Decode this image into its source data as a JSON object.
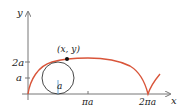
{
  "diagram": {
    "axes": {
      "x_label": "x",
      "y_label": "y"
    },
    "y_ticks": [
      {
        "label": "2a",
        "pixel_y": 62
      },
      {
        "label": "a",
        "pixel_y": 78
      }
    ],
    "x_ticks": [
      {
        "label": "πa",
        "pixel_x": 88
      },
      {
        "label": "2πa",
        "pixel_x": 148
      }
    ],
    "point_label": "(x, y)",
    "radius_label": "a",
    "colors": {
      "curve": "#d9553a",
      "circle": "#333333",
      "radius": "#6aa7d8",
      "axes": "#777777",
      "point": "#111111"
    }
  }
}
